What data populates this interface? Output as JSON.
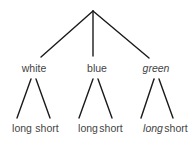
{
  "diagram": {
    "type": "tree",
    "root": {
      "x": 93,
      "y": 11
    },
    "edge_color": "#1a1a1a",
    "text_color": "#444444",
    "children": [
      {
        "label": "white",
        "italic": false,
        "x": 34,
        "y": 72,
        "edge_end": {
          "x": 41,
          "y": 57
        },
        "leaves": [
          {
            "label": "long",
            "italic": false,
            "x": 22,
            "y": 132,
            "edge": {
              "x1": 31,
              "y1": 79,
              "x2": 17,
              "y2": 118
            }
          },
          {
            "label": "short",
            "italic": false,
            "x": 47,
            "y": 132,
            "edge": {
              "x1": 36,
              "y1": 79,
              "x2": 50,
              "y2": 118
            }
          }
        ]
      },
      {
        "label": "blue",
        "italic": false,
        "x": 97,
        "y": 72,
        "edge_end": {
          "x": 93,
          "y": 56
        },
        "leaves": [
          {
            "label": "long",
            "italic": false,
            "x": 88,
            "y": 132,
            "edge": {
              "x1": 93,
              "y1": 79,
              "x2": 79,
              "y2": 118
            }
          },
          {
            "label": "short",
            "italic": false,
            "x": 111,
            "y": 132,
            "edge": {
              "x1": 98,
              "y1": 79,
              "x2": 112,
              "y2": 118
            }
          }
        ]
      },
      {
        "label": "green",
        "italic": true,
        "x": 156,
        "y": 72,
        "edge_end": {
          "x": 149,
          "y": 58
        },
        "leaves": [
          {
            "label": "long",
            "italic": true,
            "x": 153,
            "y": 132,
            "edge": {
              "x1": 154,
              "y1": 79,
              "x2": 141,
              "y2": 118
            }
          },
          {
            "label": "short",
            "italic": false,
            "x": 176,
            "y": 132,
            "edge": {
              "x1": 159,
              "y1": 79,
              "x2": 173,
              "y2": 118
            }
          }
        ]
      }
    ]
  }
}
